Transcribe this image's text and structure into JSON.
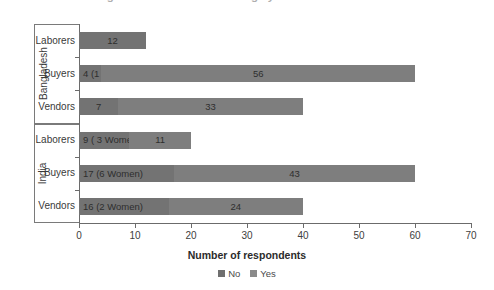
{
  "chart_data": {
    "type": "bar",
    "orientation": "horizontal",
    "stacked": true,
    "title": "...working around the house are largely safe for women",
    "xlabel": "Number of respondents",
    "ylabel": "",
    "xlim": [
      0,
      70
    ],
    "xticks": [
      0,
      10,
      20,
      30,
      40,
      50,
      60,
      70
    ],
    "grid": false,
    "legend_position": "bottom",
    "legend": [
      "No",
      "Yes"
    ],
    "groups": [
      {
        "name": "Bangladesh",
        "categories": [
          "Laborers",
          "Buyers",
          "Vendors"
        ]
      },
      {
        "name": "India",
        "categories": [
          "Laborers",
          "Buyers",
          "Vendors"
        ]
      }
    ],
    "categories": [
      "Bangladesh - Laborers",
      "Bangladesh - Buyers",
      "Bangladesh - Vendors",
      "India - Laborers",
      "India - Buyers",
      "India - Vendors"
    ],
    "series": [
      {
        "name": "No",
        "values": [
          12,
          4,
          7,
          9,
          17,
          16
        ]
      },
      {
        "name": "Yes",
        "values": [
          0,
          56,
          33,
          11,
          43,
          24
        ]
      }
    ],
    "totals": [
      12,
      60,
      40,
      20,
      60,
      40
    ],
    "bars": [
      {
        "group": "Bangladesh",
        "category": "Laborers",
        "total": 12,
        "segments": [
          {
            "series": "No",
            "value": 12,
            "label": "12"
          }
        ]
      },
      {
        "group": "Bangladesh",
        "category": "Buyers",
        "total": 60,
        "segments": [
          {
            "series": "No",
            "value": 4,
            "label": "4 (1 Woman)"
          },
          {
            "series": "Yes",
            "value": 56,
            "label": "56"
          }
        ]
      },
      {
        "group": "Bangladesh",
        "category": "Vendors",
        "total": 40,
        "segments": [
          {
            "series": "No",
            "value": 7,
            "label": "7"
          },
          {
            "series": "Yes",
            "value": 33,
            "label": "33"
          }
        ]
      },
      {
        "group": "India",
        "category": "Laborers",
        "total": 20,
        "segments": [
          {
            "series": "No",
            "value": 9,
            "label": "9 ( 3 Women)"
          },
          {
            "series": "Yes",
            "value": 11,
            "label": "11"
          }
        ]
      },
      {
        "group": "India",
        "category": "Buyers",
        "total": 60,
        "segments": [
          {
            "series": "No",
            "value": 17,
            "label": "17 (6 Women)"
          },
          {
            "series": "Yes",
            "value": 43,
            "label": "43"
          }
        ]
      },
      {
        "group": "India",
        "category": "Vendors",
        "total": 40,
        "segments": [
          {
            "series": "No",
            "value": 16,
            "label": "16 (2 Women)"
          },
          {
            "series": "Yes",
            "value": 24,
            "label": "24"
          }
        ]
      }
    ],
    "colors": {
      "no": "#737373",
      "yes": "#7e7e7e",
      "axis": "#6b6b6b",
      "text": "#3a3a3a",
      "background": "#ffffff"
    }
  }
}
